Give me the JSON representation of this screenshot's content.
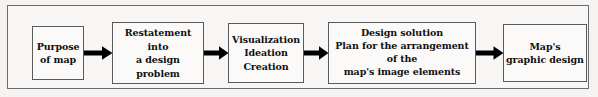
{
  "diagram": {
    "type": "horizontal-flowchart",
    "background_color": "#f4f3f1",
    "frame_color": "#6b6b6b",
    "box_fill": "#fbfaf8",
    "box_border_color": "#5a5a5a",
    "arrow_color": "#000000",
    "text_color": "#101010",
    "nodes": [
      {
        "id": "purpose",
        "label": "Purpose\nof map"
      },
      {
        "id": "restatement",
        "label": "Restatement into\na design\nproblem"
      },
      {
        "id": "visualization",
        "label": "Visualization\nIdeation\nCreation"
      },
      {
        "id": "design-solution",
        "label": "Design solution\nPlan for the arrangement\nof the\nmap's image elements"
      },
      {
        "id": "graphic-design",
        "label": "Map's\ngraphic design"
      }
    ],
    "connectors": [
      {
        "id": "arrow-0",
        "from": "purpose",
        "to": "restatement",
        "glyph": "right-arrow"
      },
      {
        "id": "arrow-1",
        "from": "restatement",
        "to": "visualization",
        "glyph": "right-arrow"
      },
      {
        "id": "arrow-2",
        "from": "visualization",
        "to": "design-solution",
        "glyph": "right-arrow"
      },
      {
        "id": "arrow-3",
        "from": "design-solution",
        "to": "graphic-design",
        "glyph": "right-arrow"
      }
    ]
  }
}
